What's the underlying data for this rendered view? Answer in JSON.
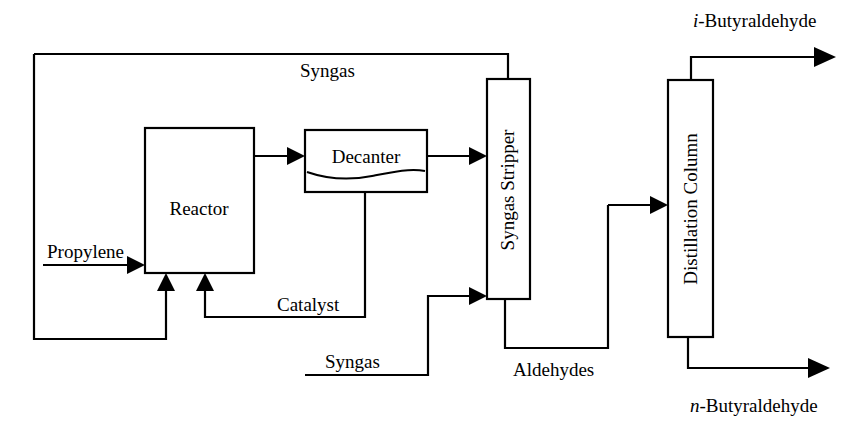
{
  "diagram": {
    "background_color": "#ffffff",
    "line_color": "#000000",
    "units": [
      {
        "id": "reactor",
        "label": "Reactor",
        "orientation": "horizontal",
        "x": 145,
        "y": 128,
        "w": 109,
        "h": 145
      },
      {
        "id": "decanter",
        "label": "Decanter",
        "orientation": "horizontal",
        "x": 305,
        "y": 130,
        "w": 122,
        "h": 62
      },
      {
        "id": "syngas-stripper",
        "label": "Syngas Stripper",
        "orientation": "vertical",
        "x": 487,
        "y": 79,
        "w": 43,
        "h": 220
      },
      {
        "id": "distillation-column",
        "label": "Distillation Column",
        "orientation": "vertical",
        "x": 668,
        "y": 80,
        "w": 45,
        "h": 257
      }
    ],
    "streams": [
      {
        "id": "syngas-recycle",
        "label": "Syngas",
        "label_x": 300,
        "label_y": 77,
        "italic_prefix": ""
      },
      {
        "id": "propylene-feed",
        "label": "Propylene",
        "label_x": 47,
        "label_y": 258,
        "italic_prefix": ""
      },
      {
        "id": "catalyst",
        "label": "Catalyst",
        "label_x": 277,
        "label_y": 311,
        "italic_prefix": ""
      },
      {
        "id": "syngas-feed",
        "label": "Syngas",
        "label_x": 325,
        "label_y": 368,
        "italic_prefix": ""
      },
      {
        "id": "aldehydes",
        "label": "Aldehydes",
        "label_x": 513,
        "label_y": 376,
        "italic_prefix": ""
      },
      {
        "id": "iso-product",
        "label": "-Butyraldehyde",
        "label_x": 693,
        "label_y": 27,
        "italic_prefix": "i"
      },
      {
        "id": "normal-product",
        "label": "-Butyraldehyde",
        "label_x": 690,
        "label_y": 412,
        "italic_prefix": "n"
      }
    ],
    "paths": {
      "syngas_recycle_top": "M 34,54 L 508,54 L 508,79",
      "syngas_recycle_down_left": "M 34,54 L 34,339 L 166,339 L 166,287",
      "propylene_feed": "M 43,265 L 137,265",
      "reactor_to_decanter": "M 254,156 L 297,156",
      "decanter_to_stripper": "M 427,156 L 479,156",
      "decanter_catalyst_down": "M 365,192 L 365,317 L 205,317 L 205,287",
      "syngas_feed_in": "M 305,375 L 428,375 L 428,296 L 479,296",
      "stripper_bottom_aldehydes": "M 505,299 L 505,348 L 608,348 L 608,205",
      "aldehydes_to_column": "M 608,205 L 660,205",
      "column_top_iso": "M 691,80 L 691,57 L 825,57",
      "column_bottom_normal": "M 688,337 L 688,368 L 819,368",
      "decanter_wave": "M 307,172 C 330,180 352,180 372,176 C 392,172 410,168 425,171"
    },
    "arrows": [
      {
        "id": "arrow-propylene-into-reactor",
        "x": 145,
        "y": 265,
        "dir": "right"
      },
      {
        "id": "arrow-recycle-into-reactor",
        "x": 166,
        "y": 273,
        "dir": "up"
      },
      {
        "id": "arrow-catalyst-into-reactor",
        "x": 205,
        "y": 273,
        "dir": "up"
      },
      {
        "id": "arrow-reactor-into-decanter",
        "x": 305,
        "y": 156,
        "dir": "right"
      },
      {
        "id": "arrow-decanter-into-stripper",
        "x": 487,
        "y": 156,
        "dir": "right"
      },
      {
        "id": "arrow-syngasfeed-into-stripper",
        "x": 487,
        "y": 296,
        "dir": "right"
      },
      {
        "id": "arrow-aldehydes-into-column",
        "x": 668,
        "y": 205,
        "dir": "right"
      },
      {
        "id": "arrow-iso-product-out",
        "x": 833,
        "y": 57,
        "dir": "right"
      },
      {
        "id": "arrow-normal-product-out",
        "x": 827,
        "y": 368,
        "dir": "right"
      }
    ]
  }
}
